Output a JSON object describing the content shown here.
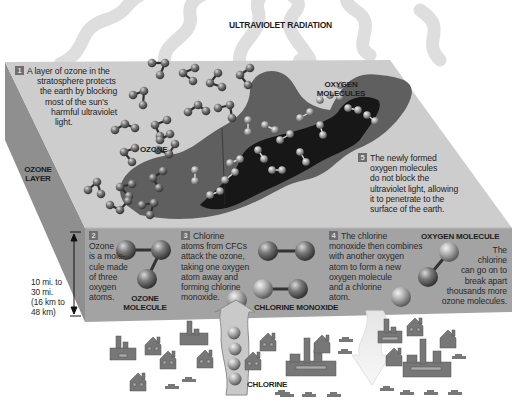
{
  "title": "ULTRAVIOLET RADIATION",
  "labels": {
    "ozone_layer": [
      "OZONE",
      "LAYER"
    ],
    "ozone": "OZONE",
    "oxygen_molecules": [
      "OXYGEN",
      "MOLECULES"
    ],
    "ozone_molecule": [
      "OZONE",
      "MOLECULE"
    ],
    "chlorine_monoxide": "CHLORINE MONOXIDE",
    "oxygen_molecule": "OXYGEN MOLECULE",
    "chlorine": "CHLORINE",
    "altitude": [
      "10 mi. to",
      "30 mi.",
      "(16 km to",
      "48 km)"
    ]
  },
  "steps": [
    {
      "number": "1",
      "lines": [
        "A layer of ozone in the",
        "stratosphere protects",
        "the earth by blocking",
        "most of the sun's",
        "harmful ultraviolet",
        "light."
      ]
    },
    {
      "number": "2",
      "lines": [
        "Ozone",
        "is a mole-",
        "cule made",
        "of three",
        "oxygen",
        "atoms."
      ]
    },
    {
      "number": "3",
      "lines": [
        "Chlorine",
        "atoms from CFCs",
        "attack the ozone,",
        "taking one oxygen",
        "atom away and",
        "forming chlorine",
        "monoxide."
      ]
    },
    {
      "number": "4",
      "lines": [
        "The chlorine",
        "monoxide then combines",
        "with another oxygen",
        "atom to form a new",
        "oxygen molecule",
        "and a chlorine",
        "atom."
      ]
    },
    {
      "number": "5",
      "lines": [
        "The newly formed",
        "oxygen molecules",
        "do not block the",
        "ultraviolet light, allowing",
        "it to penetrate to the",
        "surface of the earth."
      ]
    },
    {
      "number": "",
      "lines": [
        "The",
        "chlorine",
        "can go on to",
        "break apart",
        "thousands more",
        "ozone molecules."
      ]
    }
  ],
  "colors": {
    "top_face": "#cdcdcd",
    "front_face": "#a3a3a3",
    "side_face": "#8f8f8f",
    "hole_mid": "#5e5e5e",
    "hole_dark": "#151515",
    "uv_wave": "#dcdcdc",
    "atom": "#6f6f6f",
    "atom_light": "#a8a8a8",
    "building": "#777777"
  }
}
